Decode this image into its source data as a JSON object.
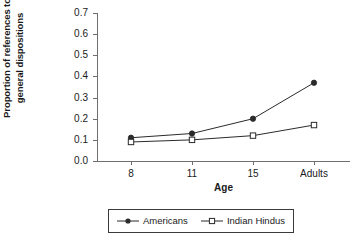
{
  "chart_data": {
    "type": "line",
    "title": "",
    "xlabel": "Age",
    "ylabel_lines": [
      "Proportion of references to",
      "general dispositions"
    ],
    "ylabel": "Proportion of references to general dispositions",
    "categories": [
      "8",
      "11",
      "15",
      "Adults"
    ],
    "ylim": [
      0.0,
      0.7
    ],
    "ytick_labels": [
      "0.7",
      "0.6",
      "0.5",
      "0.4",
      "0.3",
      "0.2",
      "0.1",
      "0.0"
    ],
    "ytick_values": [
      0.7,
      0.6,
      0.5,
      0.4,
      0.3,
      0.2,
      0.1,
      0.0
    ],
    "grid": false,
    "legend_position": "bottom-center",
    "series": [
      {
        "name": "Americans",
        "marker": "filled-circle",
        "color": "#1a1a1a",
        "values": [
          0.11,
          0.13,
          0.2,
          0.37
        ]
      },
      {
        "name": "Indian Hindus",
        "marker": "open-square",
        "color": "#1a1a1a",
        "values": [
          0.09,
          0.1,
          0.12,
          0.17
        ]
      }
    ]
  },
  "legend": {
    "entries": [
      {
        "label": "Americans"
      },
      {
        "label": "Indian Hindus"
      }
    ]
  },
  "colors": {
    "axis": "#6f6f6f",
    "line": "#2b2b2b",
    "text": "#1a1a1a",
    "background": "#ffffff",
    "legend_border": "#3a3a3a"
  }
}
